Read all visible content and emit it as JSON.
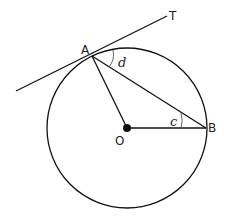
{
  "diagram": {
    "type": "circle-theorem",
    "labels": {
      "tangent_end": "T",
      "point_a": "A",
      "point_b": "B",
      "center": "O",
      "angle_d": "d",
      "angle_c": "c"
    },
    "colors": {
      "stroke": "#111111",
      "background": "#ffffff"
    }
  }
}
